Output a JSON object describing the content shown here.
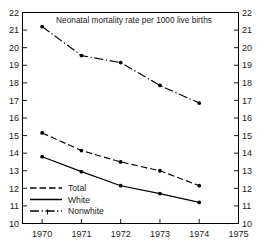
{
  "chart_data": {
    "type": "line",
    "title": "Neonatal mortality rate per 1000 live births",
    "xlabel": "",
    "ylabel": "",
    "x": [
      1970,
      1971,
      1972,
      1973,
      1974
    ],
    "xtick_labels": [
      "1970",
      "1971",
      "1972",
      "1973",
      "1974",
      "1975"
    ],
    "xlim": [
      1969.5,
      1975
    ],
    "ytick_labels": [
      "10",
      "11",
      "12",
      "13",
      "14",
      "15",
      "16",
      "17",
      "18",
      "19",
      "20",
      "21",
      "22"
    ],
    "ylim": [
      10,
      22
    ],
    "grid": false,
    "legend_position": "bottom-left",
    "dual_y_axis": true,
    "series": [
      {
        "name": "Nonwhite",
        "style": "dash-dot",
        "values": [
          21.2,
          19.55,
          19.15,
          17.85,
          16.85
        ]
      },
      {
        "name": "Total",
        "style": "dashed",
        "values": [
          15.15,
          14.15,
          13.5,
          13.0,
          12.15
        ]
      },
      {
        "name": "White",
        "style": "solid",
        "values": [
          13.8,
          12.95,
          12.15,
          11.7,
          11.2
        ]
      }
    ]
  },
  "legend": {
    "entries": [
      {
        "label": "Total",
        "style": "dashed"
      },
      {
        "label": "White",
        "style": "solid"
      },
      {
        "label": "Nonwhite",
        "style": "dash-dot"
      }
    ]
  },
  "colors": {
    "ink": "#000000",
    "background": "#ffffff"
  }
}
